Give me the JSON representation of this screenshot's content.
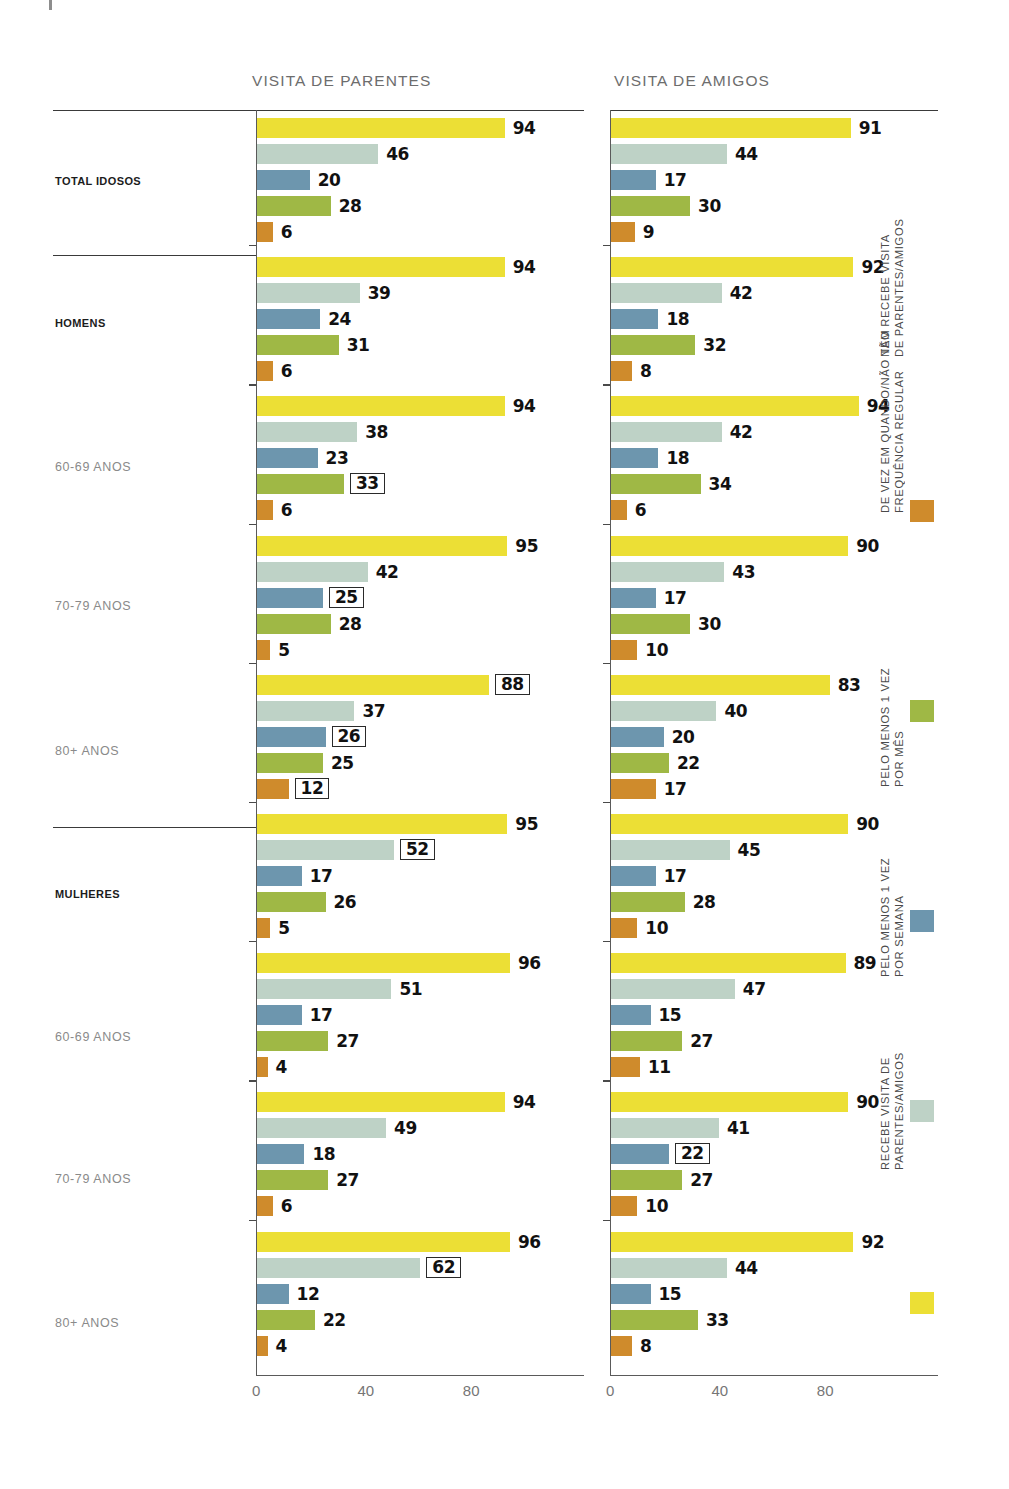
{
  "top_title": " ",
  "panels": [
    {
      "key": "parentes",
      "title": "VISITA DE PARENTES"
    },
    {
      "key": "amigos",
      "title": "VISITA DE AMIGOS"
    }
  ],
  "axis": {
    "ticks": [
      "0",
      "40",
      "80"
    ],
    "tick_values": [
      0,
      40,
      80
    ],
    "max": 110
  },
  "row_labels": [
    {
      "text": "TOTAL IDOSOS",
      "bold": true
    },
    {
      "text": "HOMENS",
      "bold": true
    },
    {
      "text": "60-69 ANOS",
      "bold": false
    },
    {
      "text": "70-79 ANOS",
      "bold": false
    },
    {
      "text": "80+ ANOS",
      "bold": false
    },
    {
      "text": "MULHERES",
      "bold": true
    },
    {
      "text": "60-69 ANOS",
      "bold": false
    },
    {
      "text": "70-79 ANOS",
      "bold": false
    },
    {
      "text": "80+ ANOS",
      "bold": false
    }
  ],
  "legend": [
    {
      "name": "nao-recebe",
      "color": "#cf8b2c",
      "line1": "NÃO RECEBE VISITA",
      "line2": "DE PARENTES/AMIGOS"
    },
    {
      "name": "de-vez-em-quando",
      "color": "#9fb845",
      "line1": "DE VEZ EM QUANDO/NÃO TEM",
      "line2": "FREQUÊNCIA REGULAR"
    },
    {
      "name": "uma-vez-mes",
      "color": "#6d96ae",
      "line1": "PELO MENOS 1 VEZ",
      "line2": "POR MÊS"
    },
    {
      "name": "uma-vez-semana",
      "color": "#bed2c6",
      "line1": "PELO MENOS 1 VEZ",
      "line2": "POR SEMANA"
    },
    {
      "name": "recebe-visita",
      "color": "#ecdf35",
      "line1": "RECEBE VISITA DE",
      "line2": "PARENTES/AMIGOS"
    }
  ],
  "colors": {
    "recebe": "#ecdf35",
    "semana": "#bed2c6",
    "mes": "#6d96ae",
    "devez": "#9fb845",
    "naorecebe": "#cf8b2c"
  },
  "chart_data": {
    "type": "bar",
    "title": "",
    "xlabel": "",
    "ylabel": "",
    "xlim": [
      0,
      110
    ],
    "grid": false,
    "legend_position": "right-vertical",
    "orientation": "horizontal",
    "categories": [
      "TOTAL IDOSOS",
      "HOMENS",
      "HOMENS 60-69 ANOS",
      "HOMENS 70-79 ANOS",
      "HOMENS 80+ ANOS",
      "MULHERES",
      "MULHERES 60-69 ANOS",
      "MULHERES 70-79 ANOS",
      "MULHERES 80+ ANOS"
    ],
    "series_names": [
      "RECEBE VISITA DE PARENTES/AMIGOS",
      "PELO MENOS 1 VEZ POR SEMANA",
      "PELO MENOS 1 VEZ POR MÊS",
      "DE VEZ EM QUANDO/NÃO TEM FREQUÊNCIA REGULAR",
      "NÃO RECEBE VISITA DE PARENTES/AMIGOS"
    ],
    "panels": [
      {
        "title": "VISITA DE PARENTES",
        "rows": [
          {
            "category": "TOTAL IDOSOS",
            "values": [
              94,
              46,
              20,
              28,
              6
            ],
            "highlight": [
              false,
              false,
              false,
              false,
              false
            ]
          },
          {
            "category": "HOMENS",
            "values": [
              94,
              39,
              24,
              31,
              6
            ],
            "highlight": [
              false,
              false,
              false,
              false,
              false
            ]
          },
          {
            "category": "HOMENS 60-69 ANOS",
            "values": [
              94,
              38,
              23,
              33,
              6
            ],
            "highlight": [
              false,
              false,
              false,
              true,
              false
            ]
          },
          {
            "category": "HOMENS 70-79 ANOS",
            "values": [
              95,
              42,
              25,
              28,
              5
            ],
            "highlight": [
              false,
              false,
              true,
              false,
              false
            ]
          },
          {
            "category": "HOMENS 80+ ANOS",
            "values": [
              88,
              37,
              26,
              25,
              12
            ],
            "highlight": [
              true,
              false,
              true,
              false,
              true
            ]
          },
          {
            "category": "MULHERES",
            "values": [
              95,
              52,
              17,
              26,
              5
            ],
            "highlight": [
              false,
              true,
              false,
              false,
              false
            ]
          },
          {
            "category": "MULHERES 60-69 ANOS",
            "values": [
              96,
              51,
              17,
              27,
              4
            ],
            "highlight": [
              false,
              false,
              false,
              false,
              false
            ]
          },
          {
            "category": "MULHERES 70-79 ANOS",
            "values": [
              94,
              49,
              18,
              27,
              6
            ],
            "highlight": [
              false,
              false,
              false,
              false,
              false
            ]
          },
          {
            "category": "MULHERES 80+ ANOS",
            "values": [
              96,
              62,
              12,
              22,
              4
            ],
            "highlight": [
              false,
              true,
              false,
              false,
              false
            ]
          }
        ]
      },
      {
        "title": "VISITA DE AMIGOS",
        "rows": [
          {
            "category": "TOTAL IDOSOS",
            "values": [
              91,
              44,
              17,
              30,
              9
            ],
            "highlight": [
              false,
              false,
              false,
              false,
              false
            ]
          },
          {
            "category": "HOMENS",
            "values": [
              92,
              42,
              18,
              32,
              8
            ],
            "highlight": [
              false,
              false,
              false,
              false,
              false
            ]
          },
          {
            "category": "HOMENS 60-69 ANOS",
            "values": [
              94,
              42,
              18,
              34,
              6
            ],
            "highlight": [
              false,
              false,
              false,
              false,
              false
            ]
          },
          {
            "category": "HOMENS 70-79 ANOS",
            "values": [
              90,
              43,
              17,
              30,
              10
            ],
            "highlight": [
              false,
              false,
              false,
              false,
              false
            ]
          },
          {
            "category": "HOMENS 80+ ANOS",
            "values": [
              83,
              40,
              20,
              22,
              17
            ],
            "highlight": [
              false,
              false,
              false,
              false,
              false
            ]
          },
          {
            "category": "MULHERES",
            "values": [
              90,
              45,
              17,
              28,
              10
            ],
            "highlight": [
              false,
              false,
              false,
              false,
              false
            ]
          },
          {
            "category": "MULHERES 60-69 ANOS",
            "values": [
              89,
              47,
              15,
              27,
              11
            ],
            "highlight": [
              false,
              false,
              false,
              false,
              false
            ]
          },
          {
            "category": "MULHERES 70-79 ANOS",
            "values": [
              90,
              41,
              22,
              27,
              10
            ],
            "highlight": [
              false,
              false,
              true,
              false,
              false
            ]
          },
          {
            "category": "MULHERES 80+ ANOS",
            "values": [
              92,
              44,
              15,
              33,
              8
            ],
            "highlight": [
              false,
              false,
              false,
              false,
              false
            ]
          }
        ]
      }
    ]
  }
}
